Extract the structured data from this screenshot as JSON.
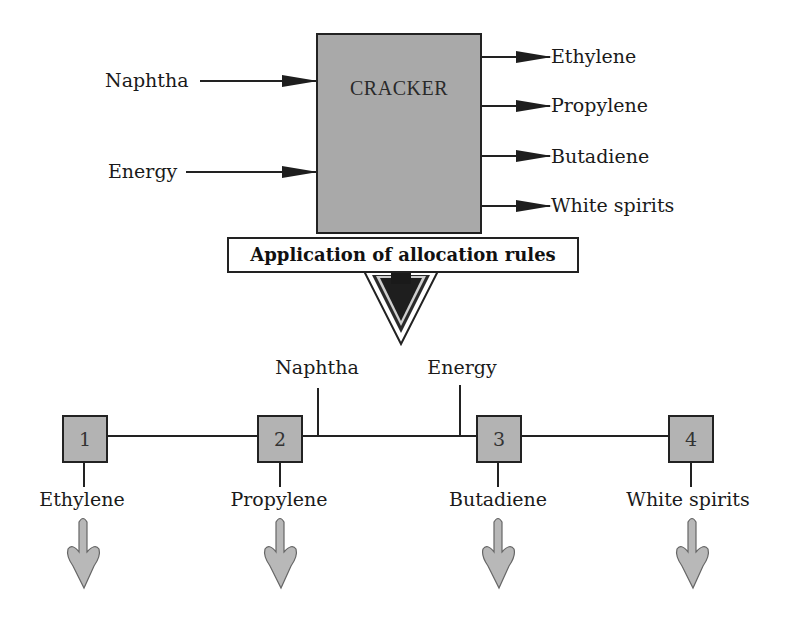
{
  "diagram": {
    "process": {
      "title": "CRACKER",
      "inputs": [
        {
          "label": "Naphtha"
        },
        {
          "label": "Energy"
        }
      ],
      "outputs": [
        {
          "label": "Ethylene"
        },
        {
          "label": "Propylene"
        },
        {
          "label": "Butadiene"
        },
        {
          "label": "White spirits"
        }
      ]
    },
    "allocation": {
      "label": "Application of allocation rules"
    },
    "subsystem": {
      "inputs": [
        {
          "label": "Naphtha"
        },
        {
          "label": "Energy"
        }
      ],
      "nodes": [
        {
          "id": "1",
          "product": "Ethylene"
        },
        {
          "id": "2",
          "product": "Propylene"
        },
        {
          "id": "3",
          "product": "Butadiene"
        },
        {
          "id": "4",
          "product": "White spirits"
        }
      ]
    },
    "colors": {
      "box_fill": "#a9a9a9",
      "node_fill": "#b3b3b3",
      "arrow_dark": "#1e1e1e",
      "small_arrow_fill": "#b8b8b8",
      "line": "#222222"
    }
  }
}
